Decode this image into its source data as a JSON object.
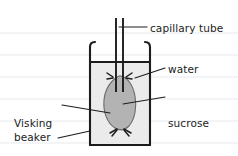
{
  "figure": {
    "background": "#ffffff",
    "ruled_line_color": "#eef0f2",
    "ink_color": "#1c1c1c",
    "water_fill": "#ebebeb",
    "tubing_fill": "#b3b3b3"
  },
  "labels": {
    "capillary_tube": "capillary tube",
    "water": "water",
    "sucrose_line1": "sucrose",
    "sucrose_line2": "solution",
    "visking_line1": "Visking",
    "visking_line2": "tubing",
    "beaker": "beaker"
  },
  "parts": {
    "capillary_tube": "capillary-tube",
    "beaker": "beaker",
    "water": "water",
    "visking_tubing": "visking-tubing",
    "sucrose_solution": "sucrose-solution",
    "top_tie": "top-tie-knot",
    "bottom_tie": "bottom-tie-knot",
    "water_surface": "water-surface-line"
  }
}
